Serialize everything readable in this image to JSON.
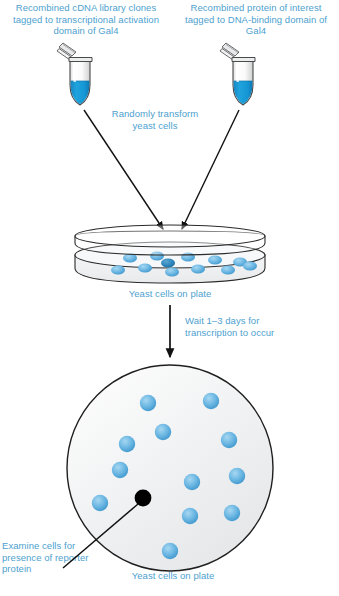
{
  "diagram": {
    "colors": {
      "text_blue": "#4e9fcf",
      "cell_blue": "#63b3e0",
      "cell_blue_dark": "#2f86bd",
      "liquid_blue": "#1b9ad6",
      "black_colony": "#000000",
      "outline": "#1a1a1a",
      "plate_fill": "#f2f3f4",
      "tube_fill": "#fbfbfb"
    },
    "labels": {
      "left_tube": "Recombined cDNA library clones tagged to transcriptional activation domain of Gal4",
      "right_tube": "Recombined protein of interest tagged to DNA-binding domain of Gal4",
      "transform_step": "Randomly transform yeast cells",
      "plate_side_caption": "Yeast cells on plate",
      "wait_step": "Wait 1–3 days for transcription to occur",
      "examine_step": "Examine cells for presence of reporter protein",
      "plate_top_caption": "Yeast cells on plate"
    },
    "tubes": [
      {
        "name": "left-tube",
        "cx": 80,
        "top": 45,
        "liquid_label": "blue solution"
      },
      {
        "name": "right-tube",
        "cx": 243,
        "top": 45,
        "liquid_label": "blue solution"
      }
    ],
    "side_plate": {
      "name": "petri-dish-side-view",
      "cells_row_top": [
        {
          "x": 130,
          "y": 258
        },
        {
          "x": 157,
          "y": 256
        },
        {
          "x": 188,
          "y": 257
        },
        {
          "x": 215,
          "y": 260
        },
        {
          "x": 240,
          "y": 262
        }
      ],
      "cells_row_bottom": [
        {
          "x": 118,
          "y": 270
        },
        {
          "x": 145,
          "y": 268
        },
        {
          "x": 172,
          "y": 272
        },
        {
          "x": 198,
          "y": 269
        },
        {
          "x": 228,
          "y": 270
        },
        {
          "x": 250,
          "y": 266
        }
      ],
      "dark_cell": {
        "x": 168,
        "y": 263
      }
    },
    "top_plate": {
      "name": "petri-dish-top-view",
      "cx": 170,
      "cy": 468,
      "r": 103,
      "blue_colonies": [
        {
          "x": 148,
          "y": 403
        },
        {
          "x": 211,
          "y": 401
        },
        {
          "x": 163,
          "y": 432
        },
        {
          "x": 229,
          "y": 440
        },
        {
          "x": 127,
          "y": 444
        },
        {
          "x": 120,
          "y": 470
        },
        {
          "x": 192,
          "y": 482
        },
        {
          "x": 237,
          "y": 476
        },
        {
          "x": 100,
          "y": 503
        },
        {
          "x": 190,
          "y": 516
        },
        {
          "x": 232,
          "y": 513
        },
        {
          "x": 170,
          "y": 551
        }
      ],
      "black_colony": {
        "x": 143,
        "y": 498
      }
    },
    "arrows": [
      {
        "name": "arrow-left-tube-to-plate"
      },
      {
        "name": "arrow-right-tube-to-plate"
      },
      {
        "name": "arrow-plate-to-top-view"
      },
      {
        "name": "leader-line-black-colony"
      }
    ]
  }
}
